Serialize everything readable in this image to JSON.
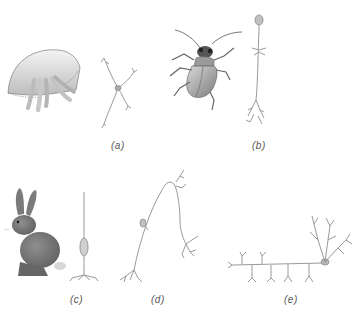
{
  "figure": {
    "type": "illustration",
    "panels": [
      {
        "id": "a",
        "label": "(a)",
        "organism": "jellyfish",
        "neuron": "multipolar nerve-net neuron"
      },
      {
        "id": "b",
        "label": "(b)",
        "organism": "insect (beetle)",
        "neuron": "unipolar neuron"
      },
      {
        "id": "c",
        "label": "(c)",
        "organism": "rabbit",
        "neuron": "bipolar neuron"
      },
      {
        "id": "d",
        "label": "(d)",
        "organism": "",
        "neuron": "pseudounipolar sensory neuron"
      },
      {
        "id": "e",
        "label": "(e)",
        "organism": "",
        "neuron": "multipolar motor neuron"
      }
    ]
  },
  "colors": {
    "background": "#ffffff",
    "line": "#9a9a9a",
    "label": "#555555",
    "animal_fill": "#8a8a8a"
  }
}
